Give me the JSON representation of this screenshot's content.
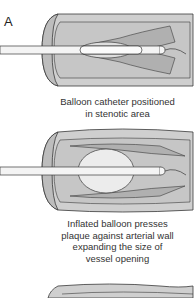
{
  "figure": {
    "panel_label": "A",
    "steps": [
      {
        "caption_lines": [
          "Balloon catheter positioned",
          "in stenotic area"
        ]
      },
      {
        "caption_lines": [
          "Inflated balloon presses",
          "plaque against arterial wall",
          "expanding the size of",
          "vessel opening"
        ]
      },
      {
        "caption_lines": []
      }
    ]
  },
  "colors": {
    "vessel_wall": "#cfcfcf",
    "lumen": "#b9b9b9",
    "plaque": "#dadada",
    "catheter": "#f4f4f4",
    "outline": "#3a3a3a"
  }
}
